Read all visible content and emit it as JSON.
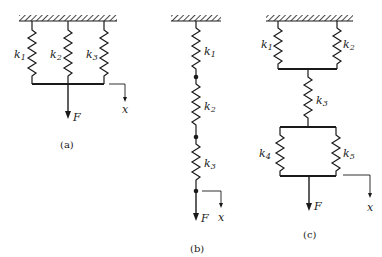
{
  "figure": {
    "a": {
      "caption": "(a)",
      "springs": [
        {
          "k": "k",
          "sub": "1"
        },
        {
          "k": "k",
          "sub": "2"
        },
        {
          "k": "k",
          "sub": "3"
        }
      ],
      "force": "F",
      "displacement": "x",
      "arrangement": "parallel"
    },
    "b": {
      "caption": "(b)",
      "springs": [
        {
          "k": "k",
          "sub": "1"
        },
        {
          "k": "k",
          "sub": "2"
        },
        {
          "k": "k",
          "sub": "3"
        }
      ],
      "force": "F",
      "displacement": "x",
      "arrangement": "series"
    },
    "c": {
      "caption": "(c)",
      "springs": [
        {
          "k": "k",
          "sub": "1"
        },
        {
          "k": "k",
          "sub": "2"
        },
        {
          "k": "k",
          "sub": "3"
        },
        {
          "k": "k",
          "sub": "4"
        },
        {
          "k": "k",
          "sub": "5"
        }
      ],
      "force": "F",
      "displacement": "x",
      "arrangement": "combined"
    }
  },
  "colors": {
    "ink": "#1a1a1a",
    "background": "#ffffff"
  }
}
